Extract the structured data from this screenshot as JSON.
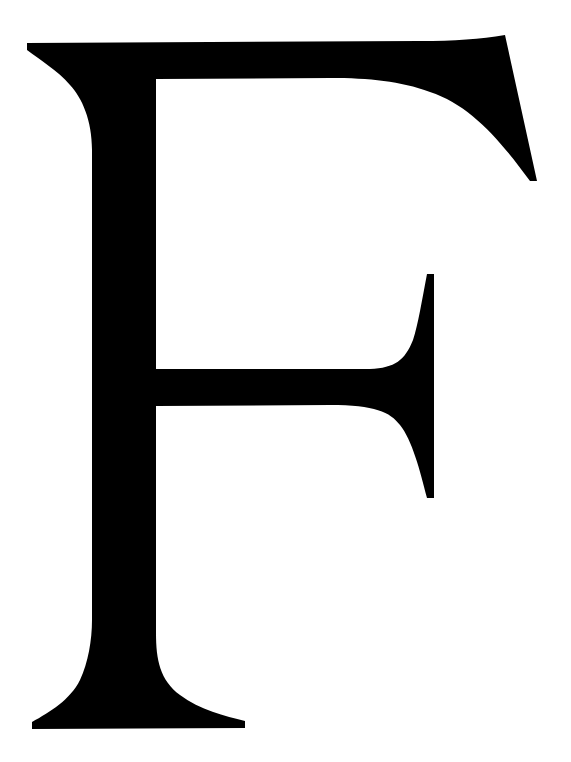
{
  "image": {
    "glyph": "F",
    "description": "Large black serif capital letter F on white background",
    "colors": {
      "foreground": "#000000",
      "background": "#ffffff"
    }
  }
}
